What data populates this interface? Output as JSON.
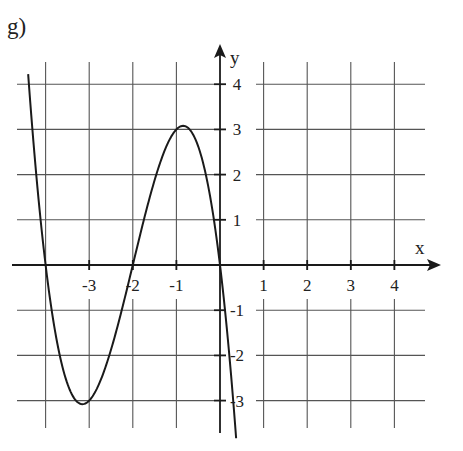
{
  "figure": {
    "panel_label": "g)"
  },
  "chart_data": {
    "type": "line",
    "title": "g)",
    "xlabel": "x",
    "ylabel": "y",
    "x_ticks": [
      -3,
      -2,
      -1,
      1,
      2,
      3,
      4
    ],
    "x_tick_labels": [
      "-3",
      "-2",
      "-1",
      "1",
      "2",
      "3",
      "4"
    ],
    "y_ticks": [
      4,
      3,
      2,
      1,
      -1,
      -2,
      -3
    ],
    "y_tick_labels": [
      "4",
      "3",
      "2",
      "1",
      "-1",
      "-2",
      "-3"
    ],
    "xlim": [
      -4.5,
      4.9
    ],
    "ylim": [
      -3.8,
      4.9
    ],
    "grid": true,
    "grid_x": [
      -4,
      -3,
      -2,
      -1,
      1,
      2,
      3,
      4
    ],
    "grid_y": [
      -3,
      -2,
      -1,
      1,
      2,
      3,
      4
    ],
    "series": [
      {
        "name": "f(x) = -x(x+2)(x+4)",
        "x": [
          -4.4,
          -4.2,
          -4.0,
          -3.8,
          -3.6,
          -3.4,
          -3.155,
          -3.0,
          -2.8,
          -2.6,
          -2.4,
          -2.2,
          -2.0,
          -1.8,
          -1.6,
          -1.4,
          -1.2,
          -1.0,
          -0.845,
          -0.6,
          -0.4,
          -0.2,
          0.0,
          0.2,
          0.37
        ],
        "y": [
          4.22,
          1.85,
          0.0,
          -1.37,
          -2.3,
          -2.86,
          -3.08,
          -3.0,
          -2.69,
          -2.18,
          -1.54,
          -0.79,
          0.0,
          0.76,
          1.54,
          2.18,
          2.69,
          3.0,
          3.08,
          2.86,
          2.3,
          1.37,
          0.0,
          -0.92,
          -3.7
        ]
      }
    ],
    "key_points": {
      "roots": [
        -4,
        -2,
        0
      ],
      "local_min": [
        -3.15,
        -3.08
      ],
      "local_max": [
        -0.85,
        3.08
      ]
    }
  }
}
